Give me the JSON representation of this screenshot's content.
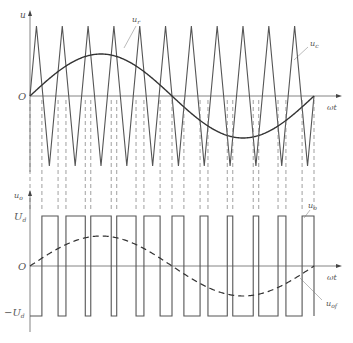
{
  "upper_panel": {
    "y_axis_label": "u",
    "x_axis_label": "ωt",
    "origin_label": "O",
    "reference_label": {
      "main": "u",
      "sub": "r"
    },
    "carrier_label": {
      "main": "u",
      "sub": "c"
    }
  },
  "lower_panel": {
    "y_axis_label": {
      "main": "u",
      "sub": "o"
    },
    "x_axis_label": "ωt",
    "origin_label": "O",
    "pos_level_label": {
      "main": "U",
      "sub": "d"
    },
    "neg_level_label": {
      "main": "−U",
      "sub": "d"
    },
    "output_label": {
      "main": "u",
      "sub": "o"
    },
    "fundamental_label": {
      "main": "u",
      "sub": "of"
    }
  },
  "model": {
    "note": "Waveform parameters set by eye from the screenshot; pulse edges are computed, not measured.",
    "carrier_periods_per_cycle": 11,
    "modulation_index": 0.6,
    "fundamental_cycles": 1,
    "carrier_starts_at": "zero-rising"
  },
  "colors": {
    "line": "#555555",
    "axis": "#666666",
    "dash": "#777777"
  }
}
